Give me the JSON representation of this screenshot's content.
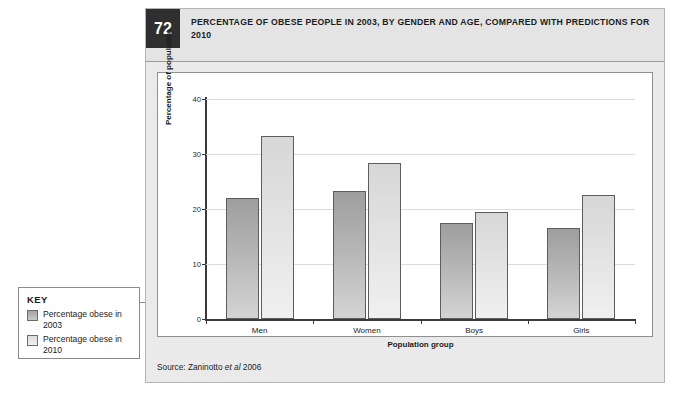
{
  "figure": {
    "number": "72",
    "title": "PERCENTAGE OF OBESE PEOPLE IN 2003, BY GENDER AND AGE, COMPARED WITH PREDICTIONS FOR 2010",
    "source_prefix": "Source: Zaninotto ",
    "source_italic": "et al",
    "source_suffix": " 2006"
  },
  "key": {
    "title": "KEY",
    "items": [
      {
        "label": "Percentage obese in 2003",
        "color": "#b5b5b5"
      },
      {
        "label": "Percentage obese in 2010",
        "color": "#e6e6e6"
      }
    ]
  },
  "chart_data": {
    "type": "bar",
    "title": "PERCENTAGE OF OBESE PEOPLE IN 2003, BY GENDER AND AGE, COMPARED WITH PREDICTIONS FOR 2010",
    "xlabel": "Population group",
    "ylabel": "Percentage of population",
    "categories": [
      "Men",
      "Women",
      "Boys",
      "Girls"
    ],
    "ylim": [
      0,
      40
    ],
    "yticks": [
      0,
      10,
      20,
      30,
      40
    ],
    "ytick_labels": [
      "0",
      "10",
      "20",
      "30",
      "40"
    ],
    "grid": true,
    "legend_position": "external-left",
    "series": [
      {
        "name": "Percentage obese in 2003",
        "color": "#b5b5b5",
        "values": [
          22.0,
          23.2,
          17.5,
          16.5
        ]
      },
      {
        "name": "Percentage obese in 2010",
        "color": "#e6e6e6",
        "values": [
          33.3,
          28.3,
          19.4,
          22.6
        ]
      }
    ]
  }
}
